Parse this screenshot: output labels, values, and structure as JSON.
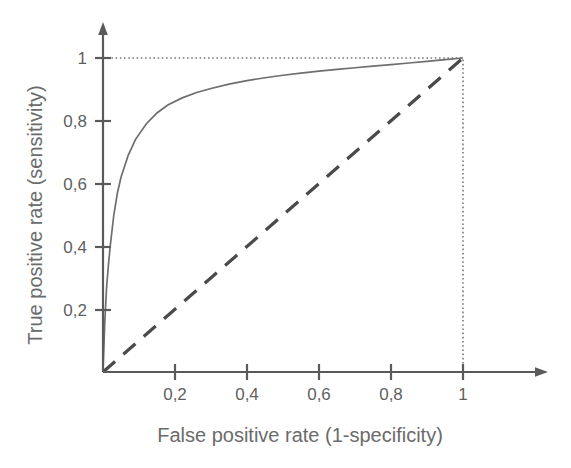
{
  "chart_data": {
    "type": "line",
    "title": "",
    "xlabel": "False positive rate (1-specificity)",
    "ylabel": "True positive rate (sensitivity)",
    "xlim": [
      0,
      1
    ],
    "ylim": [
      0,
      1
    ],
    "grid": false,
    "legend": "none",
    "decimal_separator": ",",
    "xticks": [
      0.2,
      0.4,
      0.6,
      0.8,
      1
    ],
    "xtick_labels": [
      "0,2",
      "0,4",
      "0,6",
      "0,8",
      "1"
    ],
    "yticks": [
      0.2,
      0.4,
      0.6,
      0.8,
      1
    ],
    "ytick_labels": [
      "0,2",
      "0,4",
      "0,6",
      "0,8",
      "1"
    ],
    "series": [
      {
        "name": "ROC curve",
        "style": "solid",
        "color": "#6e6e6e",
        "x": [
          0,
          0.005,
          0.01,
          0.015,
          0.02,
          0.03,
          0.04,
          0.05,
          0.07,
          0.09,
          0.12,
          0.15,
          0.18,
          0.22,
          0.26,
          0.3,
          0.35,
          0.4,
          0.45,
          0.5,
          0.55,
          0.6,
          0.65,
          0.7,
          0.75,
          0.8,
          0.85,
          0.9,
          0.95,
          1.0
        ],
        "y": [
          0,
          0.16,
          0.27,
          0.34,
          0.4,
          0.5,
          0.57,
          0.62,
          0.69,
          0.74,
          0.79,
          0.825,
          0.85,
          0.873,
          0.89,
          0.903,
          0.917,
          0.928,
          0.937,
          0.945,
          0.952,
          0.958,
          0.964,
          0.969,
          0.974,
          0.979,
          0.984,
          0.989,
          0.995,
          1.0
        ]
      },
      {
        "name": "Chance diagonal",
        "style": "dashed",
        "color": "#4a4a4a",
        "x": [
          0,
          1
        ],
        "y": [
          0,
          1
        ]
      }
    ],
    "guides": [
      {
        "name": "horizontal-guide-at-1",
        "style": "dotted",
        "from": [
          0,
          1
        ],
        "to": [
          1,
          1
        ]
      },
      {
        "name": "vertical-guide-at-1",
        "style": "dotted",
        "from": [
          1,
          0
        ],
        "to": [
          1,
          1
        ]
      }
    ]
  },
  "axes": {
    "x_label": "False positive rate (1-specificity)",
    "y_label": "True positive rate (sensitivity)",
    "x_tick_labels": [
      "0,2",
      "0,4",
      "0,6",
      "0,8",
      "1"
    ],
    "y_tick_labels": [
      "0,2",
      "0,4",
      "0,6",
      "0,8",
      "1"
    ]
  },
  "colors": {
    "axis": "#5a5a5a",
    "curve": "#6e6e6e",
    "diagonal": "#4a4a4a",
    "guide": "#7a7a7a",
    "text": "#6b6b6b",
    "background": "#ffffff"
  }
}
